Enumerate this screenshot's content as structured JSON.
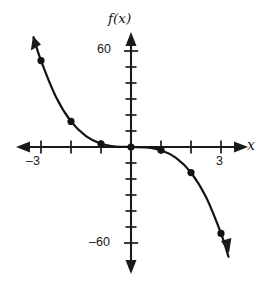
{
  "figure": {
    "name": "cubic-function-graph",
    "background_color": "#ffffff",
    "ink_color": "#1a1a1a"
  },
  "axes": {
    "y_axis_label": "f(x)",
    "x_axis_label": "x",
    "origin_px": [
      131,
      147
    ],
    "x_tick_spacing_px": 30,
    "y_tick_spacing_px": 16,
    "x_units_per_tick": 1,
    "y_units_per_tick": 10,
    "x_tick_labels": [
      {
        "text": "–3",
        "value": -3
      },
      {
        "text": "3",
        "value": 3
      }
    ],
    "y_tick_labels": [
      {
        "text": "60",
        "value": 60
      },
      {
        "text": "–60",
        "value": -60
      }
    ],
    "x_tick_values": [
      -3,
      -2,
      -1,
      1,
      2,
      3
    ],
    "y_tick_values": [
      60,
      50,
      40,
      30,
      20,
      10,
      -10,
      -20,
      -30,
      -40,
      -50,
      -60
    ],
    "arrows": [
      "left",
      "right",
      "up",
      "down"
    ]
  },
  "chart_data": {
    "type": "line",
    "title": "",
    "subtitle": "",
    "xlabel": "x",
    "ylabel": "f(x)",
    "xlim": [
      -3.6,
      3.6
    ],
    "ylim": [
      -80,
      75
    ],
    "grid": false,
    "legend": null,
    "function": "f(x) = -2x^3",
    "series": [
      {
        "name": "f(x) = -2x^3",
        "marked_points": [
          {
            "x": -3,
            "y": 54
          },
          {
            "x": -2,
            "y": 16
          },
          {
            "x": -1,
            "y": 2
          },
          {
            "x": 0,
            "y": 0
          },
          {
            "x": 1,
            "y": -2
          },
          {
            "x": 2,
            "y": -16
          },
          {
            "x": 3,
            "y": -54
          }
        ],
        "x": [
          -3.25,
          -3,
          -2.5,
          -2,
          -1.5,
          -1,
          -0.5,
          0,
          0.5,
          1,
          1.5,
          2,
          2.5,
          3,
          3.25
        ],
        "values": [
          68.6,
          54,
          31.3,
          16,
          6.8,
          2,
          0.25,
          0,
          -0.25,
          -2,
          -6.8,
          -16,
          -31.3,
          -54,
          -68.6
        ]
      }
    ],
    "marker_style": "filled-circle",
    "marker_color": "#131313",
    "line_color": "#131313"
  }
}
